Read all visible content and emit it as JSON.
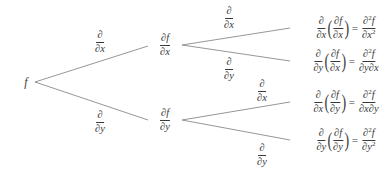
{
  "diagram": {
    "type": "tree",
    "root": {
      "label": "f"
    },
    "level1": [
      {
        "edge_label": {
          "num": "∂",
          "den": "∂x"
        },
        "node": {
          "num": "∂f",
          "den": "∂x"
        }
      },
      {
        "edge_label": {
          "num": "∂",
          "den": "∂y"
        },
        "node": {
          "num": "∂f",
          "den": "∂y"
        }
      }
    ],
    "level2": [
      {
        "edge_label": {
          "num": "∂",
          "den": "∂x"
        },
        "result": {
          "op_num": "∂",
          "op_den": "∂x",
          "inner_num": "∂f",
          "inner_den": "∂x",
          "eq": "=",
          "res_num": "∂",
          "res_num_sup": "2",
          "res_num_var": "f",
          "res_den": "∂x",
          "res_den_sup": "2"
        }
      },
      {
        "edge_label": {
          "num": "∂",
          "den": "∂y"
        },
        "result": {
          "op_num": "∂",
          "op_den": "∂y",
          "inner_num": "∂f",
          "inner_den": "∂x",
          "eq": "=",
          "res_num": "∂",
          "res_num_sup": "2",
          "res_num_var": "f",
          "res_den": "∂y∂x",
          "res_den_sup": ""
        }
      },
      {
        "edge_label": {
          "num": "∂",
          "den": "∂x"
        },
        "result": {
          "op_num": "∂",
          "op_den": "∂x",
          "inner_num": "∂f",
          "inner_den": "∂y",
          "eq": "=",
          "res_num": "∂",
          "res_num_sup": "2",
          "res_num_var": "f",
          "res_den": "∂x∂y",
          "res_den_sup": ""
        }
      },
      {
        "edge_label": {
          "num": "∂",
          "den": "∂y"
        },
        "result": {
          "op_num": "∂",
          "op_den": "∂y",
          "inner_num": "∂f",
          "inner_den": "∂y",
          "eq": "=",
          "res_num": "∂",
          "res_num_sup": "2",
          "res_num_var": "f",
          "res_den": "∂y",
          "res_den_sup": "2"
        }
      }
    ],
    "colors": {
      "line": "#8a8a8a",
      "text": "#3a3a3a",
      "background": "#ffffff"
    }
  }
}
